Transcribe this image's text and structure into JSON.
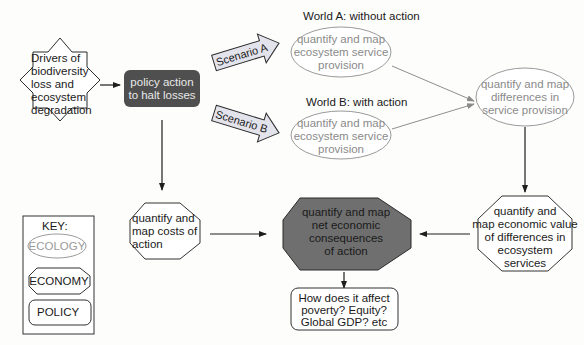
{
  "diagram": {
    "colors": {
      "background": "#fdfdfc",
      "ecology_stroke": "#9a9a9a",
      "ecology_text": "#8a8a8a",
      "economy_stroke": "#333333",
      "policy_fill": "#555555",
      "highlight_fill": "#6f6f6f",
      "scenario_arrow_fill": "#e4e4ec",
      "connector": "#2a2a2a",
      "connector_light": "#8f8f8f"
    },
    "nodes": {
      "drivers": {
        "type": "star",
        "lines": [
          "Drivers of",
          "biodiversity",
          "loss and",
          "ecosystem",
          "degradation"
        ]
      },
      "policy_action": {
        "type": "policy-filled",
        "lines": [
          "policy action",
          "to halt losses"
        ]
      },
      "scenario_a": {
        "type": "scenario-arrow",
        "label": "Scenario A"
      },
      "scenario_b": {
        "type": "scenario-arrow",
        "label": "Scenario B"
      },
      "world_a": {
        "title": "World A: without action",
        "type": "ecology",
        "lines": [
          "quantify and map",
          "ecosystem service",
          "provision"
        ]
      },
      "world_b": {
        "title": "World B: with action",
        "type": "ecology",
        "lines": [
          "quantify and map",
          "ecosystem service",
          "provision"
        ]
      },
      "differences": {
        "type": "ecology",
        "lines": [
          "quantify and map",
          "differences in",
          "service provision"
        ]
      },
      "economic_value": {
        "type": "economy",
        "lines": [
          "quantify and",
          "map economic value",
          "of differences in",
          "ecosystem",
          "services"
        ]
      },
      "costs": {
        "type": "economy",
        "lines": [
          "quantify and",
          "map costs of",
          "action"
        ]
      },
      "net_consequences": {
        "type": "economy-filled",
        "lines": [
          "quantify and map",
          "net economic",
          "consequences",
          "of action"
        ]
      },
      "impacts": {
        "type": "policy",
        "lines": [
          "How does it affect",
          "poverty? Equity?",
          "Global GDP? etc"
        ]
      }
    },
    "key": {
      "title": "KEY:",
      "items": [
        {
          "shape": "ellipse",
          "label": "ECOLOGY"
        },
        {
          "shape": "octagon",
          "label": "ECONOMY"
        },
        {
          "shape": "rounded-rect",
          "label": "POLICY"
        }
      ]
    },
    "edges": [
      {
        "from": "drivers",
        "to": "policy_action"
      },
      {
        "from": "policy_action",
        "to": "scenario_a"
      },
      {
        "from": "policy_action",
        "to": "scenario_b"
      },
      {
        "from": "policy_action",
        "to": "costs"
      },
      {
        "from": "world_a",
        "to": "differences"
      },
      {
        "from": "world_b",
        "to": "differences"
      },
      {
        "from": "differences",
        "to": "economic_value"
      },
      {
        "from": "economic_value",
        "to": "net_consequences"
      },
      {
        "from": "costs",
        "to": "net_consequences"
      },
      {
        "from": "net_consequences",
        "to": "impacts"
      }
    ]
  }
}
